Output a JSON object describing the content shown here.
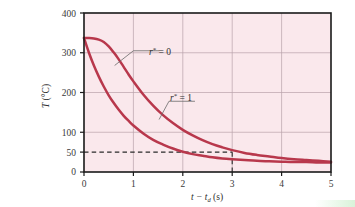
{
  "chart_data": {
    "type": "line",
    "title": "",
    "xlabel": "t − t_d (s)",
    "xlabel_parts": {
      "lead": "t − t",
      "sub": "d",
      "tail": " (s)"
    },
    "ylabel": "T (°C)",
    "xlim": [
      0,
      5
    ],
    "ylim": [
      0,
      400
    ],
    "xticks": [
      0,
      1,
      2,
      3,
      4,
      5
    ],
    "xticklabels": [
      "0",
      "1",
      "2",
      "3",
      "4",
      "5"
    ],
    "yticks": [
      0,
      50,
      100,
      200,
      300,
      400
    ],
    "yticklabels": [
      "0",
      "50",
      "100",
      "200",
      "300",
      "400"
    ],
    "gridlines_x": [
      1,
      2,
      3,
      4
    ],
    "gridlines_y": [
      100,
      200,
      300
    ],
    "grid": true,
    "legend": "inline-annotations",
    "plot_bg_color": "#fae8ec",
    "grid_color": "#b8a0a8",
    "curve_color": "#b8384c",
    "axis_color": "#1a1a1a",
    "series": [
      {
        "name": "r* = 0",
        "label_parts": {
          "var": "r",
          "star": "*",
          "eq": " = 0"
        },
        "x": [
          0.0,
          0.1,
          0.2,
          0.3,
          0.4,
          0.5,
          0.6,
          0.7,
          0.8,
          0.9,
          1.0,
          1.2,
          1.4,
          1.6,
          1.8,
          2.0,
          2.2,
          2.4,
          2.6,
          2.8,
          3.0,
          3.25,
          3.5,
          3.75,
          4.0,
          4.25,
          4.5,
          4.75,
          5.0
        ],
        "y": [
          337,
          337,
          336,
          333,
          327,
          316,
          301,
          284,
          265,
          246,
          228,
          195,
          167,
          143,
          123,
          106,
          92,
          80,
          70,
          62,
          55,
          48,
          43,
          39,
          35,
          32,
          30,
          28,
          26
        ],
        "annotation_point": {
          "x": 0.62,
          "y": 268
        },
        "label_position": {
          "x": 1.22,
          "y": 243
        }
      },
      {
        "name": "r* = 1",
        "label_parts": {
          "var": "r",
          "star": "*",
          "eq": " = 1"
        },
        "x": [
          0.0,
          0.1,
          0.2,
          0.3,
          0.4,
          0.5,
          0.6,
          0.7,
          0.8,
          0.9,
          1.0,
          1.2,
          1.4,
          1.6,
          1.8,
          2.0,
          2.2,
          2.4,
          2.6,
          2.8,
          3.0,
          3.25,
          3.5,
          3.75,
          4.0,
          4.25,
          4.5,
          4.75,
          5.0
        ],
        "y": [
          337,
          300,
          268,
          240,
          215,
          193,
          174,
          157,
          142,
          129,
          117,
          97,
          81,
          69,
          59,
          51,
          45,
          41,
          37,
          34,
          32,
          30,
          28,
          27,
          26,
          25,
          25,
          24,
          24
        ],
        "annotation_point": {
          "x": 1.52,
          "y": 132
        },
        "label_position": {
          "x": 1.92,
          "y": 160
        }
      }
    ],
    "reference_lines": [
      {
        "name": "temperature-threshold",
        "orientation": "horizontal",
        "value": 50,
        "from_x": 0,
        "to_x": 3,
        "style": "dashed",
        "color": "#2a2a2a"
      },
      {
        "name": "time-threshold",
        "orientation": "vertical",
        "value": 3,
        "from_y": 0,
        "to_y": 50,
        "style": "dashed",
        "color": "#2a2a2a"
      }
    ]
  }
}
